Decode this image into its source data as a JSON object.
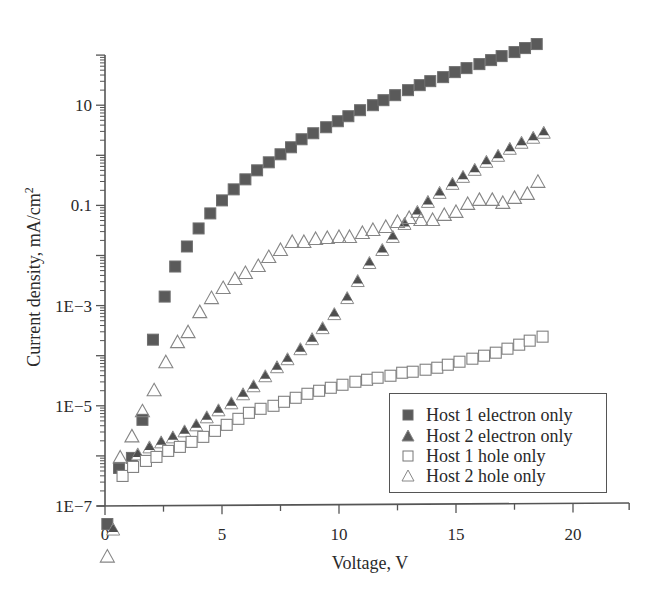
{
  "chart_data": {
    "type": "scatter",
    "title": "",
    "xlabel": "Voltage, V",
    "ylabel": "Current density, mA/cm2",
    "ylabel_superscript": "2",
    "ylabel_base": "Current density, mA/cm",
    "xscale": "linear",
    "yscale": "log",
    "xlim": [
      0,
      22.4
    ],
    "ylim": [
      1e-07,
      100
    ],
    "x_ticks": [
      0,
      5,
      10,
      15,
      20
    ],
    "x_tick_labels": [
      "0",
      "5",
      "10",
      "15",
      "20"
    ],
    "y_ticks": [
      1e-07,
      1e-05,
      0.001,
      0.1,
      10
    ],
    "y_tick_labels": [
      "1E−7",
      "1E−5",
      "1E−3",
      "0.1",
      "10"
    ],
    "grid": false,
    "legend_position": "lower right",
    "series": [
      {
        "name": "Host 1 electron only",
        "marker": "square-filled",
        "color": "#5a5a5a",
        "x": [
          0.1,
          0.6,
          1.15,
          1.6,
          2.05,
          2.55,
          3.0,
          3.5,
          4.0,
          4.5,
          5.0,
          5.5,
          6.0,
          6.5,
          7.0,
          7.5,
          7.95,
          8.4,
          8.9,
          9.45,
          9.95,
          10.4,
          10.9,
          11.45,
          11.9,
          12.4,
          12.95,
          13.45,
          13.9,
          14.45,
          14.95,
          15.45,
          16.0,
          16.5,
          16.95,
          17.5,
          17.95,
          18.45
        ],
        "log10_y": [
          -7.36,
          -6.24,
          -6.04,
          -5.28,
          -3.68,
          -2.82,
          -2.22,
          -1.82,
          -1.46,
          -1.16,
          -0.9,
          -0.68,
          -0.48,
          -0.3,
          -0.14,
          0.02,
          0.16,
          0.32,
          0.44,
          0.56,
          0.68,
          0.78,
          0.9,
          1.0,
          1.1,
          1.2,
          1.3,
          1.4,
          1.48,
          1.56,
          1.66,
          1.74,
          1.82,
          1.9,
          1.98,
          2.06,
          2.14,
          2.22
        ],
        "y": [
          4.4e-08,
          5.8e-07,
          9.1e-07,
          5.2e-06,
          0.00021,
          0.0015,
          0.006,
          0.015,
          0.035,
          0.069,
          0.13,
          0.21,
          0.33,
          0.5,
          0.72,
          1.0,
          1.4,
          2.1,
          2.8,
          3.6,
          4.8,
          6.0,
          7.9,
          10,
          13,
          16,
          20,
          25,
          30,
          36,
          46,
          55,
          66,
          79,
          95,
          115,
          138,
          166
        ]
      },
      {
        "name": "Host 2 electron only",
        "marker": "triangle-filled",
        "color": "#5a5a5a",
        "x": [
          0.35,
          1.4,
          1.9,
          2.4,
          2.9,
          3.4,
          3.9,
          4.35,
          4.85,
          5.4,
          5.9,
          6.35,
          6.85,
          7.35,
          7.8,
          8.35,
          8.85,
          9.3,
          9.8,
          10.35,
          10.8,
          11.3,
          11.85,
          12.3,
          12.8,
          13.35,
          13.8,
          14.3,
          14.85,
          15.3,
          15.8,
          16.3,
          16.8,
          17.3,
          17.8,
          18.3,
          18.75
        ],
        "log10_y": [
          -7.48,
          -5.98,
          -5.84,
          -5.74,
          -5.64,
          -5.52,
          -5.4,
          -5.24,
          -5.1,
          -4.96,
          -4.78,
          -4.62,
          -4.42,
          -4.24,
          -4.08,
          -3.88,
          -3.68,
          -3.46,
          -3.18,
          -2.86,
          -2.52,
          -2.16,
          -1.9,
          -1.64,
          -1.38,
          -1.14,
          -0.94,
          -0.76,
          -0.58,
          -0.44,
          -0.3,
          -0.14,
          -0.02,
          0.12,
          0.24,
          0.34,
          0.44
        ],
        "y": [
          3.3e-08,
          1e-06,
          1.4e-06,
          1.8e-06,
          2.3e-06,
          3e-06,
          4e-06,
          5.8e-06,
          7.9e-06,
          1.1e-05,
          1.7e-05,
          2.4e-05,
          3.8e-05,
          5.8e-05,
          8.3e-05,
          0.00013,
          0.00021,
          0.00035,
          0.00066,
          0.0014,
          0.003,
          0.0069,
          0.013,
          0.023,
          0.042,
          0.072,
          0.11,
          0.17,
          0.26,
          0.36,
          0.5,
          0.72,
          0.95,
          1.3,
          1.7,
          2.2,
          2.8
        ]
      },
      {
        "name": "Host 1 hole only",
        "marker": "square-open",
        "color": "#5a5a5a",
        "x": [
          0.75,
          1.2,
          1.75,
          2.2,
          2.7,
          3.2,
          3.7,
          4.2,
          4.7,
          5.2,
          5.7,
          6.15,
          6.65,
          7.2,
          7.65,
          8.15,
          8.65,
          9.15,
          9.65,
          10.15,
          10.7,
          11.2,
          11.65,
          12.2,
          12.7,
          13.15,
          13.7,
          14.2,
          14.65,
          15.15,
          15.7,
          16.2,
          16.7,
          17.2,
          17.7,
          18.15,
          18.7
        ],
        "log10_y": [
          -6.4,
          -6.22,
          -6.1,
          -6.02,
          -5.9,
          -5.82,
          -5.72,
          -5.62,
          -5.5,
          -5.38,
          -5.26,
          -5.14,
          -5.06,
          -5.0,
          -4.92,
          -4.84,
          -4.76,
          -4.7,
          -4.64,
          -4.58,
          -4.52,
          -4.48,
          -4.44,
          -4.4,
          -4.34,
          -4.32,
          -4.28,
          -4.24,
          -4.18,
          -4.12,
          -4.06,
          -4.0,
          -3.94,
          -3.86,
          -3.78,
          -3.7,
          -3.62
        ],
        "y": [
          4e-07,
          6e-07,
          7.9e-07,
          9.5e-07,
          1.3e-06,
          1.5e-06,
          1.9e-06,
          2.4e-06,
          3.2e-06,
          4.2e-06,
          5.5e-06,
          7.2e-06,
          8.7e-06,
          1e-05,
          1.2e-05,
          1.4e-05,
          1.7e-05,
          2e-05,
          2.3e-05,
          2.6e-05,
          3e-05,
          3.3e-05,
          3.6e-05,
          4e-05,
          4.6e-05,
          4.8e-05,
          5.2e-05,
          5.8e-05,
          6.6e-05,
          7.6e-05,
          8.7e-05,
          0.0001,
          0.00011,
          0.00014,
          0.00017,
          0.0002,
          0.00024
        ]
      },
      {
        "name": "Host 2 hole only",
        "marker": "triangle-open",
        "color": "#5a5a5a",
        "x": [
          0.1,
          0.65,
          1.15,
          1.6,
          2.1,
          2.6,
          3.1,
          3.55,
          4.05,
          4.55,
          5.05,
          5.55,
          6.0,
          6.55,
          7.0,
          7.5,
          8.0,
          8.5,
          9.0,
          9.5,
          10.0,
          10.45,
          11.0,
          11.45,
          12.0,
          12.5,
          13.0,
          13.5,
          14.0,
          14.5,
          15.0,
          15.5,
          16.0,
          16.55,
          17.0,
          17.5,
          18.05,
          18.5
        ],
        "log10_y": [
          -8.02,
          -6.04,
          -5.62,
          -5.12,
          -4.7,
          -4.14,
          -3.74,
          -3.54,
          -3.14,
          -2.86,
          -2.66,
          -2.48,
          -2.36,
          -2.22,
          -2.04,
          -1.9,
          -1.74,
          -1.74,
          -1.68,
          -1.66,
          -1.64,
          -1.64,
          -1.56,
          -1.5,
          -1.44,
          -1.34,
          -1.26,
          -1.3,
          -1.3,
          -1.2,
          -1.14,
          -0.98,
          -0.9,
          -0.9,
          -0.96,
          -0.86,
          -0.78,
          -0.54
        ],
        "y": [
          9.5e-09,
          9.1e-07,
          2.4e-06,
          7.6e-06,
          2e-05,
          7.2e-05,
          0.00018,
          0.00029,
          0.00072,
          0.0014,
          0.0022,
          0.0033,
          0.0044,
          0.006,
          0.0091,
          0.013,
          0.018,
          0.018,
          0.021,
          0.022,
          0.023,
          0.023,
          0.028,
          0.032,
          0.036,
          0.046,
          0.055,
          0.05,
          0.05,
          0.063,
          0.072,
          0.1,
          0.13,
          0.13,
          0.11,
          0.14,
          0.17,
          0.29
        ]
      }
    ]
  },
  "axes": {
    "x_title": "Voltage, V",
    "y_title_base": "Current density, mA/cm",
    "y_title_sup": "2"
  },
  "legend": {
    "items": [
      {
        "label": "Host 1 electron only",
        "marker": "square-filled"
      },
      {
        "label": "Host 2 electron only",
        "marker": "triangle-filled"
      },
      {
        "label": "Host 1 hole only",
        "marker": "square-open"
      },
      {
        "label": "Host 2 hole only",
        "marker": "triangle-open"
      }
    ]
  },
  "colors": {
    "axis": "#555555",
    "marker_fill": "#5a5a5a",
    "marker_stroke": "#6a6a6a",
    "text": "#2a2a2a"
  }
}
